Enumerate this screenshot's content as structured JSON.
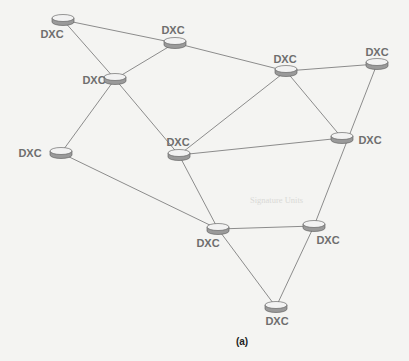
{
  "figure": {
    "caption": "(a)",
    "caption_pos": [
      242,
      341
    ],
    "colors": {
      "background": "#f4f4f2",
      "edge": "#8c8c8c",
      "node_top": "#f2f2f2",
      "node_side": "#9a9a9a",
      "node_outline": "#555555",
      "label": "#6e6e6e"
    },
    "nodes": [
      {
        "id": "n1",
        "label": "DXC",
        "x": 63,
        "y": 20,
        "lx": 52,
        "ly": 34
      },
      {
        "id": "n2",
        "label": "DXC",
        "x": 175,
        "y": 43,
        "lx": 173,
        "ly": 30
      },
      {
        "id": "n3",
        "label": "DXC",
        "x": 115,
        "y": 79,
        "lx": 94,
        "ly": 80
      },
      {
        "id": "n4",
        "label": "DXC",
        "x": 286,
        "y": 71,
        "lx": 285,
        "ly": 59
      },
      {
        "id": "n5",
        "label": "DXC",
        "x": 377,
        "y": 64,
        "lx": 377,
        "ly": 52
      },
      {
        "id": "n6",
        "label": "DXC",
        "x": 61,
        "y": 153,
        "lx": 30,
        "ly": 153
      },
      {
        "id": "n7",
        "label": "DXC",
        "x": 179,
        "y": 155,
        "lx": 178,
        "ly": 142
      },
      {
        "id": "n8",
        "label": "DXC",
        "x": 342,
        "y": 138,
        "lx": 370,
        "ly": 140
      },
      {
        "id": "n9",
        "label": "DXC",
        "x": 218,
        "y": 229,
        "lx": 208,
        "ly": 243
      },
      {
        "id": "n10",
        "label": "DXC",
        "x": 314,
        "y": 226,
        "lx": 328,
        "ly": 240
      },
      {
        "id": "n11",
        "label": "DXC",
        "x": 276,
        "y": 307,
        "lx": 277,
        "ly": 321
      }
    ],
    "edges": [
      [
        "n1",
        "n2"
      ],
      [
        "n1",
        "n3"
      ],
      [
        "n2",
        "n3"
      ],
      [
        "n2",
        "n4"
      ],
      [
        "n3",
        "n6"
      ],
      [
        "n3",
        "n7"
      ],
      [
        "n4",
        "n5"
      ],
      [
        "n4",
        "n7"
      ],
      [
        "n4",
        "n8"
      ],
      [
        "n5",
        "n10"
      ],
      [
        "n7",
        "n8"
      ],
      [
        "n6",
        "n9"
      ],
      [
        "n7",
        "n9"
      ],
      [
        "n9",
        "n10"
      ],
      [
        "n9",
        "n11"
      ],
      [
        "n10",
        "n11"
      ]
    ]
  },
  "bleed_text": {
    "heading": "Signature Units",
    "heading_pos": [
      260,
      200
    ]
  }
}
